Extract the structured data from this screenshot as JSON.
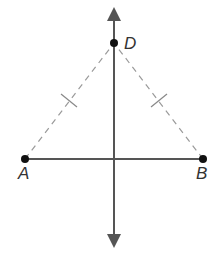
{
  "diagram": {
    "points": {
      "A": {
        "label": "A",
        "x": 25,
        "y": 159
      },
      "B": {
        "label": "B",
        "x": 203,
        "y": 159
      },
      "D": {
        "label": "D",
        "x": 114,
        "y": 43
      }
    },
    "perpendicular_bisector": {
      "x": 114,
      "y_top": 10,
      "y_bottom": 245
    },
    "segment": "AB",
    "dashed_segments": [
      "AD",
      "BD"
    ],
    "congruence_marks": "single tick on AD and BD",
    "colors": {
      "line": "#555555",
      "point": "#111111",
      "dashed": "#9a9a9a"
    }
  }
}
